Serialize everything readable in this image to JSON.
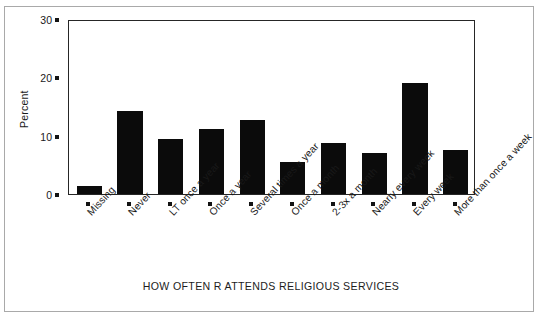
{
  "chart_data": {
    "type": "bar",
    "title": "",
    "xlabel": "HOW OFTEN R ATTENDS RELIGIOUS SERVICES",
    "ylabel": "Percent",
    "ylim": [
      0,
      30
    ],
    "yticks": [
      0,
      10,
      20,
      30
    ],
    "grid": false,
    "legend": null,
    "categories": [
      "Missing",
      "Never",
      "LT once a year",
      "Once a year",
      "Several times a year",
      "Once a month",
      "2-3x a month",
      "Nearly every week",
      "Every week",
      "More than once a week"
    ],
    "values": [
      1.3,
      14.2,
      9.4,
      11.2,
      12.7,
      5.5,
      8.7,
      7.0,
      19.1,
      7.6
    ]
  },
  "axes": {
    "y_tick_labels": [
      "0",
      "10",
      "20",
      "30"
    ],
    "y_title": "Percent",
    "x_title": "HOW OFTEN R ATTENDS RELIGIOUS SERVICES"
  },
  "colors": {
    "bar_fill": "#0b0b0b",
    "axis": "#262626",
    "frame": "#a9a9a9",
    "background": "#ffffff",
    "text": "#1a1a1a"
  }
}
